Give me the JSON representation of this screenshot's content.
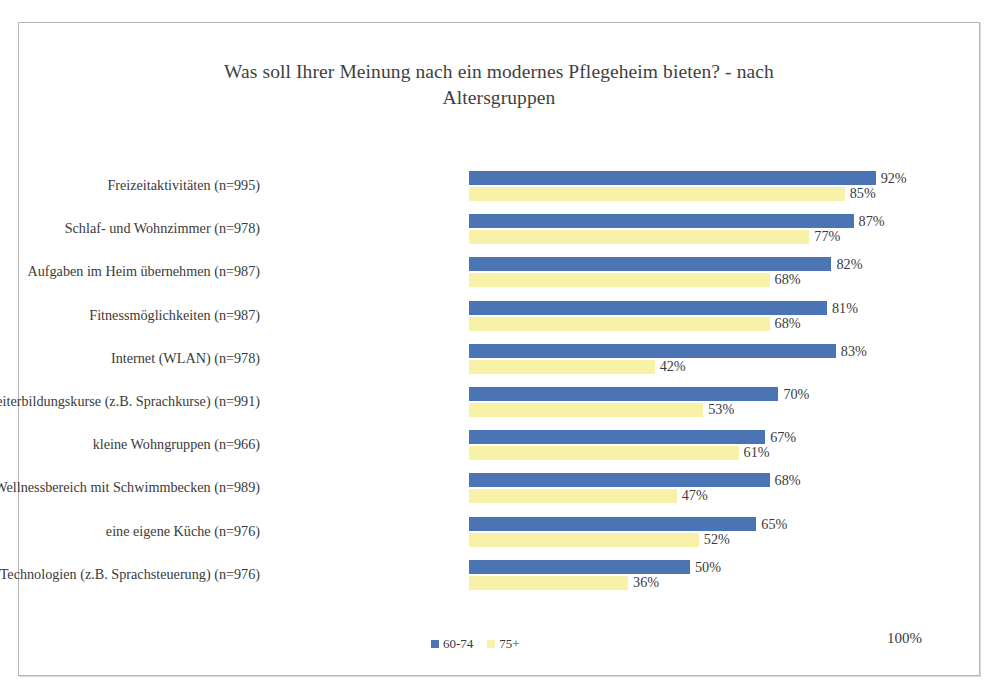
{
  "chart_data": {
    "type": "bar",
    "orientation": "horizontal",
    "title": "Was soll Ihrer Meinung nach ein modernes Pflegeheim bieten? - nach Altersgruppen",
    "title_line1": "Was soll Ihrer Meinung nach ein modernes Pflegeheim bieten? - nach",
    "title_line2": "Altersgruppen",
    "xlabel": "",
    "ylabel": "",
    "xlim": [
      0,
      100
    ],
    "grid": false,
    "legend_position": "bottom",
    "axis_max_label": "100%",
    "value_suffix": "%",
    "categories": [
      "Freizeitaktivitäten  (n=995)",
      "Schlaf- und Wohnzimmer (n=978)",
      "Aufgaben im Heim übernehmen (n=987)",
      "Fitnessmöglichkeiten (n=987)",
      "Internet (WLAN) (n=978)",
      "Weiterbildungskurse (z.B. Sprachkurse) (n=991)",
      "kleine Wohngruppen (n=966)",
      "Wellnessbereich mit Schwimmbecken (n=989)",
      "eine eigene Küche (n=976)",
      "neueste Technologien (z.B. Sprachsteuerung)  (n=976)"
    ],
    "series": [
      {
        "name": "60-74",
        "color": "#4a74b4",
        "values": [
          92,
          87,
          82,
          81,
          83,
          70,
          67,
          68,
          65,
          50
        ],
        "labels": [
          "92%",
          "87%",
          "82%",
          "81%",
          "83%",
          "70%",
          "67%",
          "68%",
          "65%",
          "50%"
        ]
      },
      {
        "name": "75+",
        "color": "#f7f2a8",
        "values": [
          85,
          77,
          68,
          68,
          42,
          53,
          61,
          47,
          52,
          36
        ],
        "labels": [
          "85%",
          "77%",
          "68%",
          "68%",
          "42%",
          "53%",
          "61%",
          "47%",
          "52%",
          "36%"
        ]
      }
    ]
  },
  "legend": {
    "items": [
      {
        "label": "60-74",
        "color": "#4a74b4"
      },
      {
        "label": "75+",
        "color": "#f7f2a8"
      }
    ]
  }
}
